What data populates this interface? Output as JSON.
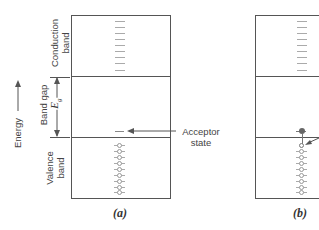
{
  "axis": {
    "energy_label": "Energy",
    "gap_symbol": "E",
    "gap_subscript": "g"
  },
  "bands": {
    "conduction": "Conduction band",
    "conduction_line1": "Conduction",
    "conduction_line2": "band",
    "gap": "Band gap",
    "valence_line1": "Valence",
    "valence_line2": "band"
  },
  "annotations": {
    "acceptor_line1": "Acceptor",
    "acceptor_line2": "state"
  },
  "panels": [
    {
      "caption": "(a)",
      "description": "Acceptor state in band gap, empty"
    },
    {
      "caption": "(b)",
      "description": "Electron excited from valence band into acceptor state, leaving hole"
    }
  ],
  "colors": {
    "line": "#555555",
    "state_dash": "#aaaaaa",
    "electron": "#666666"
  }
}
